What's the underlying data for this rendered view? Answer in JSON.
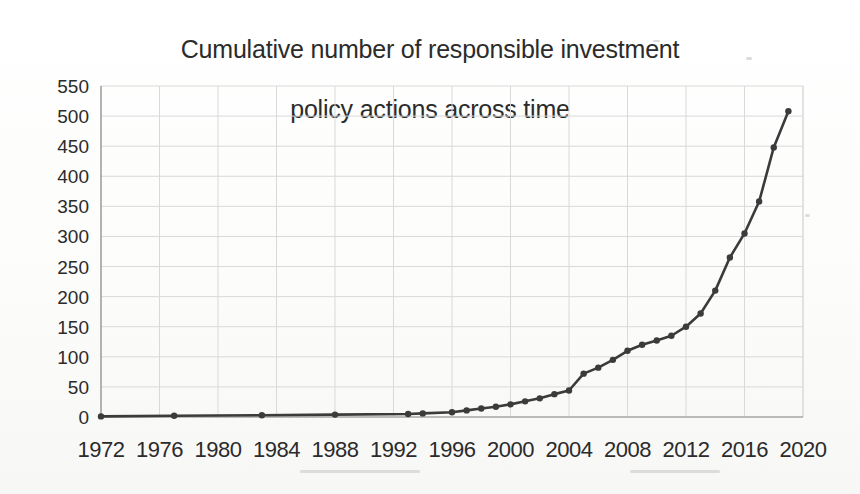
{
  "figure": {
    "title": "Cumulative number of responsible investment\npolicy actions across time",
    "title_line_1": "Cumulative number of responsible investment",
    "title_line_2": "policy actions across time",
    "background_color": "#fdfdfc",
    "line_color": "#3b3b3b",
    "grid_color": "#d9d9d9",
    "axis_color": "#8d8d8d",
    "text_color": "#2b2b2b"
  },
  "chart_data": {
    "type": "line",
    "title": "Cumulative number of responsible investment policy actions across time",
    "xlabel": "",
    "ylabel": "",
    "xlim": [
      1972,
      2020
    ],
    "ylim": [
      0,
      550
    ],
    "grid": true,
    "legend": "none",
    "marker": "circle",
    "y_ticks": [
      0,
      50,
      100,
      150,
      200,
      250,
      300,
      350,
      400,
      450,
      500,
      550
    ],
    "y_tick_labels": [
      "0",
      "50",
      "100",
      "150",
      "200",
      "250",
      "300",
      "350",
      "400",
      "450",
      "500",
      "550"
    ],
    "x_ticks": [
      1972,
      1976,
      1980,
      1984,
      1988,
      1992,
      1996,
      2000,
      2004,
      2008,
      2012,
      2016,
      2020
    ],
    "x_tick_labels": [
      "1972",
      "1976",
      "1980",
      "1984",
      "1988",
      "1992",
      "1996",
      "2000",
      "2004",
      "2008",
      "2012",
      "2016",
      "2020"
    ],
    "series": [
      {
        "name": "Cumulative policy actions",
        "x": [
          1972,
          1977,
          1983,
          1988,
          1993,
          1994,
          1996,
          1997,
          1998,
          1999,
          2000,
          2001,
          2002,
          2003,
          2004,
          2005,
          2006,
          2007,
          2008,
          2009,
          2010,
          2011,
          2012,
          2013,
          2014,
          2015,
          2016,
          2017,
          2018,
          2019
        ],
        "values": [
          1,
          2,
          3,
          4,
          5,
          6,
          8,
          11,
          14,
          17,
          21,
          26,
          31,
          38,
          44,
          72,
          82,
          95,
          110,
          120,
          127,
          135,
          150,
          172,
          210,
          265,
          305,
          358,
          448,
          508
        ]
      }
    ]
  }
}
